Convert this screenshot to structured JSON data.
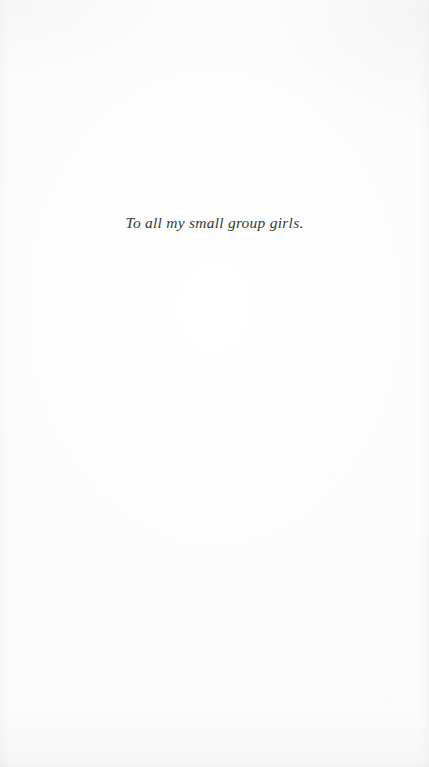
{
  "page": {
    "kind": "book-dedication-page",
    "background_color": "#fdfdfd",
    "paper_tone": "#ffffff"
  },
  "dedication": {
    "text": "To all my small group girls.",
    "text_color": "#38383a",
    "alignment": "center",
    "style": "italic-serif"
  }
}
